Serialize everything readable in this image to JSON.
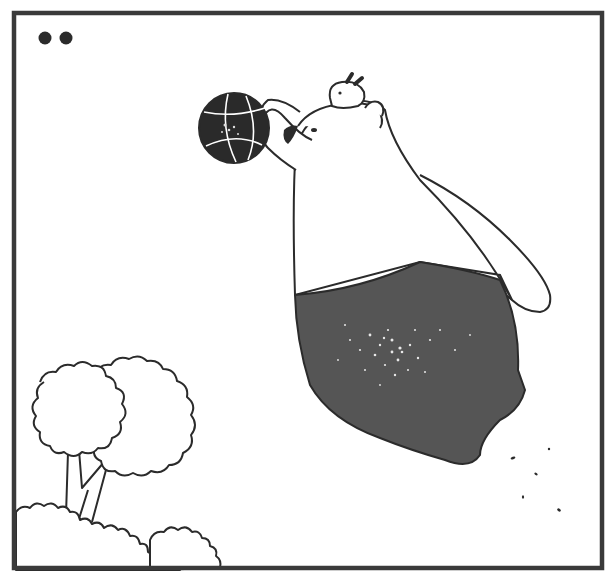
{
  "panel": {
    "description": "Comic panel: a polar bear in dark shorts leaps to dunk a basketball, with a small bunny riding on its head, beside a bushy tree",
    "page_marker_dots": 2,
    "colors": {
      "background": "#ffffff",
      "border": "#3a3a3a",
      "ink": "#2b2b2b",
      "shorts": "#555555",
      "ball": "#2a2a2a",
      "speckle": "#e8e8e8"
    }
  },
  "elements": {
    "border": "panel-frame",
    "dots": "page-marker-dots",
    "bear": "polar-bear",
    "bunny": "bunny-on-head",
    "ball": "basketball",
    "tree": "tree",
    "bushes": "bushes",
    "debris": "falling-debris"
  }
}
